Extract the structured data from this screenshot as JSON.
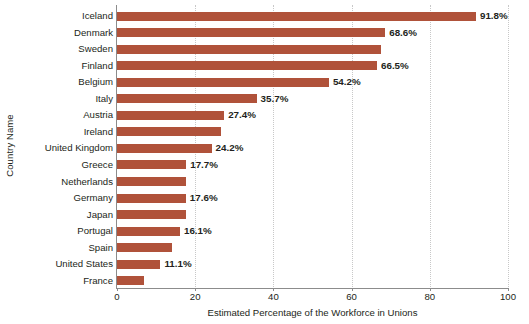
{
  "chart_data": {
    "type": "bar",
    "orientation": "horizontal",
    "title": "",
    "xlabel": "Estimated Percentage of the Workforce in Unions",
    "ylabel": "Country Name",
    "xlim": [
      0,
      100
    ],
    "xticks": [
      0,
      20,
      40,
      60,
      80,
      100
    ],
    "xtick_labels": [
      "0",
      "20",
      "40",
      "60",
      "80",
      "100"
    ],
    "grid": "vertical-dotted",
    "legend": "none",
    "bar_color": "#b0523a",
    "categories": [
      "Iceland",
      "Denmark",
      "Sweden",
      "Finland",
      "Belgium",
      "Italy",
      "Austria",
      "Ireland",
      "United Kingdom",
      "Greece",
      "Netherlands",
      "Germany",
      "Japan",
      "Portugal",
      "Spain",
      "United States",
      "France"
    ],
    "values": [
      91.8,
      68.6,
      67.5,
      66.5,
      54.2,
      35.7,
      27.4,
      26.6,
      24.2,
      17.7,
      17.7,
      17.6,
      17.6,
      16.1,
      14.1,
      11.1,
      7.0
    ],
    "data_labels": [
      "91.8%",
      "68.6%",
      "",
      "66.5%",
      "54.2%",
      "35.7%",
      "27.4%",
      "",
      "24.2%",
      "17.7%",
      "",
      "17.6%",
      "",
      "16.1%",
      "",
      "11.1%",
      ""
    ]
  }
}
